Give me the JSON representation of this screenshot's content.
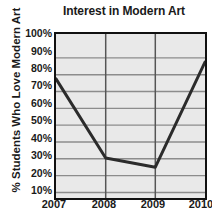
{
  "chart_data": {
    "type": "line",
    "title": "Interest in Modern Art",
    "xlabel": "",
    "ylabel": "% Students Who Love Modern Art",
    "categories": [
      "2007",
      "2008",
      "2009",
      "2010"
    ],
    "x": [
      2007,
      2008,
      2009,
      2010
    ],
    "values": [
      77.5,
      30.5,
      25,
      87.5
    ],
    "series": [
      {
        "name": "% Students Who Love Modern Art",
        "values": [
          77.5,
          30.5,
          25,
          87.5
        ]
      }
    ],
    "ytick_labels": [
      "100%",
      "90%",
      "80%",
      "70%",
      "60%",
      "50%",
      "40%",
      "30%",
      "20%",
      "10%"
    ],
    "ytick_values": [
      100,
      90,
      80,
      70,
      60,
      50,
      40,
      30,
      20,
      10
    ],
    "xtick_labels": [
      "2007",
      "2008",
      "2009",
      "2010"
    ],
    "ylim": [
      6.7,
      104.2
    ],
    "xlim": [
      2007,
      2010
    ],
    "grid": true,
    "legend": false,
    "legend_position": "none",
    "colors": {
      "plot_background": "#e9e9e9",
      "gridline": "#8c8c8c",
      "axis_border": "#111111",
      "data_line": "#2b2b2b",
      "text": "#1a1a1a",
      "figure_background": "#ffffff"
    },
    "line_width_px": 3
  }
}
